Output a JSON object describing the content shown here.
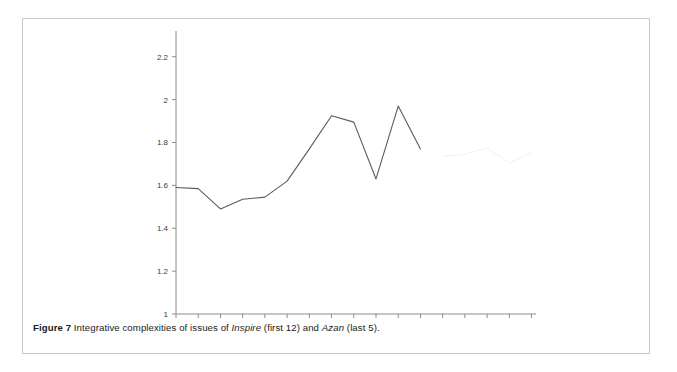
{
  "figure": {
    "caption_label": "Figure 7",
    "caption_text_1": " Integrative complexities of issues of ",
    "caption_em_1": "Inspire",
    "caption_text_2": " (first 12) and ",
    "caption_em_2": "Azan",
    "caption_text_3": " (last 5)."
  },
  "colors": {
    "series_inspire": "#5a5a5a",
    "series_azan": "#f2f2f2",
    "axis": "#8a8a8a",
    "tick_label": "#3c3c3c",
    "card_border": "#c9c9c9",
    "background": "#ffffff"
  },
  "chart_data": {
    "type": "line",
    "title": "",
    "xlabel": "",
    "ylabel": "",
    "xlim": [
      1,
      17.2
    ],
    "ylim": [
      1,
      2.32
    ],
    "grid": false,
    "legend": "none",
    "x_ticks_major": [
      2,
      4,
      6,
      8,
      10,
      12,
      14,
      16
    ],
    "x_ticks_minor": [
      1,
      3,
      5,
      7,
      9,
      11,
      13,
      15,
      17
    ],
    "x_tick_labels": [
      "2",
      "4",
      "6",
      "8",
      "10",
      "12",
      "14",
      "16"
    ],
    "y_ticks": [
      1,
      1.2,
      1.4,
      1.6,
      1.8,
      2,
      2.2
    ],
    "y_tick_labels": [
      "1",
      "1.2",
      "1.4",
      "1.6",
      "1.8",
      "2",
      "2.2"
    ],
    "series": [
      {
        "name": "Inspire (first 12)",
        "color": "#5a5a5a",
        "x": [
          1,
          2,
          3,
          4,
          5,
          6,
          7,
          8,
          9,
          10,
          11,
          12
        ],
        "values": [
          1.59,
          1.585,
          1.49,
          1.535,
          1.545,
          1.62,
          1.77,
          1.925,
          1.895,
          1.63,
          1.97,
          1.77
        ]
      },
      {
        "name": "Azan (last 5)",
        "color": "#f2f2f2",
        "x": [
          13,
          14,
          15,
          16,
          17
        ],
        "values": [
          1.735,
          1.745,
          1.775,
          1.705,
          1.75
        ]
      }
    ]
  }
}
